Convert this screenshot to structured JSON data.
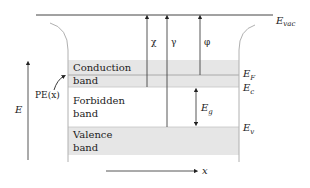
{
  "diagram": {
    "levels": {
      "vacuum": {
        "label": "E",
        "sub": "vac"
      },
      "fermi": {
        "label": "E",
        "sub": "F"
      },
      "conduction_edge": {
        "label": "E",
        "sub": "c"
      },
      "valence_edge": {
        "label": "E",
        "sub": "v"
      }
    },
    "bands": [
      {
        "id": "conduction",
        "line1": "Conduction",
        "line2": "band",
        "shaded": true
      },
      {
        "id": "forbidden",
        "line1": "Forbidden",
        "line2": "band",
        "shaded": false
      },
      {
        "id": "valence",
        "line1": "Valence",
        "line2": "band",
        "shaded": true
      }
    ],
    "arrows": {
      "chi": "χ",
      "gamma": "γ",
      "phi": "φ",
      "gap": {
        "label": "E",
        "sub": "g"
      }
    },
    "axes": {
      "energy": "E",
      "position": "x",
      "potential_label": "PE(x)"
    },
    "colors": {
      "band_fill": "#e6e6e6",
      "line": "#444444",
      "wall": "#b0b0b0"
    }
  }
}
